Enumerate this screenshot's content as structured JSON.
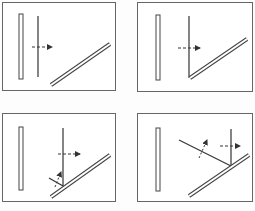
{
  "diagram": {
    "type": "wavefront-reflection-sequence",
    "panels": [
      {
        "id": 1,
        "position": "top-left",
        "stage": "incident wavefront approaching mirror"
      },
      {
        "id": 2,
        "position": "top-right",
        "stage": "wavefront touches mirror"
      },
      {
        "id": 3,
        "position": "bottom-left",
        "stage": "partial reflection begins"
      },
      {
        "id": 4,
        "position": "bottom-right",
        "stage": "reflected wavefront propagating"
      }
    ],
    "colors": {
      "line": "#333333",
      "border": "#666666",
      "background": "#ffffff"
    }
  }
}
